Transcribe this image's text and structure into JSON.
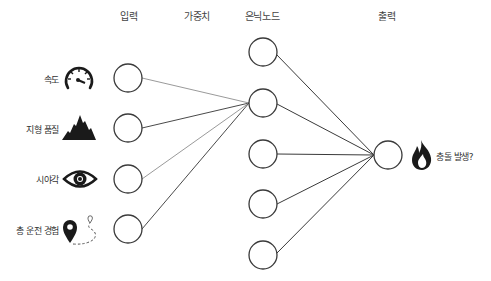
{
  "diagram": {
    "type": "neural-network",
    "headers": {
      "input": "입력",
      "weights": "가중치",
      "hidden": "은닉노드",
      "output": "출력"
    },
    "inputs": [
      {
        "label": "속도",
        "icon": "speedometer-icon"
      },
      {
        "label": "지형 품질",
        "icon": "mountain-icon"
      },
      {
        "label": "시야각",
        "icon": "eye-icon"
      },
      {
        "label": "총 운전 경험",
        "icon": "map-pin-route-icon"
      }
    ],
    "hidden_node_count": 5,
    "output": {
      "label": "충돌 발생?",
      "icon": "fire-icon"
    },
    "colors": {
      "node_stroke": "#3a3a3a",
      "edge_dark": "#4a4a4a",
      "edge_light": "#9a9a9a",
      "icon_fill": "#1a1a1a"
    }
  }
}
